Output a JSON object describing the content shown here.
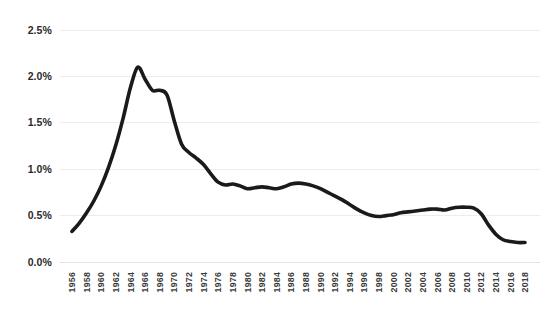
{
  "chart_data": {
    "type": "line",
    "title": "",
    "subtitle": "",
    "xlabel": "",
    "ylabel": "",
    "grid": true,
    "legend": false,
    "legend_position": "none",
    "line_color": "#1a1a1a",
    "background_color": "#ffffff",
    "gridline_color": "#ececec",
    "ylim": [
      0.0,
      2.5
    ],
    "yticks": [
      0.0,
      0.5,
      1.0,
      1.5,
      2.0,
      2.5
    ],
    "ytick_labels": [
      "0.0%",
      "0.5%",
      "1.0%",
      "1.5%",
      "2.0%",
      "2.5%"
    ],
    "xlim": [
      1956,
      2018
    ],
    "xtick_labels": [
      "1956",
      "1958",
      "1960",
      "1962",
      "1964",
      "1966",
      "1968",
      "1970",
      "1972",
      "1974",
      "1976",
      "1978",
      "1980",
      "1982",
      "1984",
      "1986",
      "1988",
      "1990",
      "1992",
      "1994",
      "1996",
      "1998",
      "2000",
      "2002",
      "2004",
      "2006",
      "2008",
      "2010",
      "2012",
      "2014",
      "2016",
      "2018"
    ],
    "series": [
      {
        "name": "series-1",
        "x": [
          1956,
          1957,
          1958,
          1959,
          1960,
          1961,
          1962,
          1963,
          1964,
          1965,
          1966,
          1967,
          1968,
          1969,
          1970,
          1971,
          1972,
          1973,
          1974,
          1975,
          1976,
          1977,
          1978,
          1979,
          1980,
          1981,
          1982,
          1983,
          1984,
          1985,
          1986,
          1987,
          1988,
          1989,
          1990,
          1991,
          1992,
          1993,
          1994,
          1995,
          1996,
          1997,
          1998,
          1999,
          2000,
          2001,
          2002,
          2003,
          2004,
          2005,
          2006,
          2007,
          2008,
          2009,
          2010,
          2011,
          2012,
          2013,
          2014,
          2015,
          2016,
          2017,
          2018
        ],
        "values": [
          0.33,
          0.42,
          0.53,
          0.66,
          0.82,
          1.02,
          1.26,
          1.55,
          1.88,
          2.1,
          1.97,
          1.85,
          1.85,
          1.8,
          1.52,
          1.27,
          1.18,
          1.12,
          1.05,
          0.95,
          0.86,
          0.83,
          0.84,
          0.82,
          0.79,
          0.8,
          0.81,
          0.8,
          0.79,
          0.81,
          0.84,
          0.85,
          0.84,
          0.82,
          0.79,
          0.75,
          0.71,
          0.67,
          0.62,
          0.57,
          0.53,
          0.5,
          0.49,
          0.5,
          0.51,
          0.53,
          0.54,
          0.55,
          0.56,
          0.57,
          0.57,
          0.56,
          0.58,
          0.59,
          0.59,
          0.58,
          0.52,
          0.4,
          0.3,
          0.24,
          0.22,
          0.21,
          0.21
        ]
      }
    ],
    "annotations": []
  }
}
